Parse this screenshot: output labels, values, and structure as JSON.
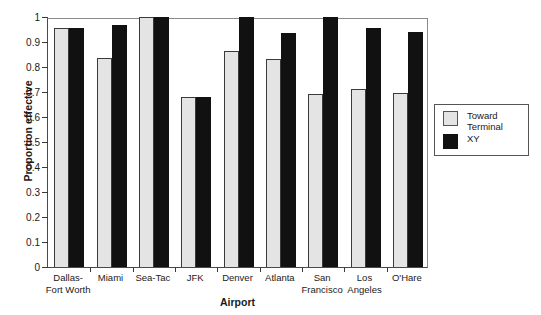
{
  "chart_data": {
    "type": "bar",
    "title": "",
    "xlabel": "Airport",
    "ylabel": "Proportion effective",
    "ylim": [
      0,
      1
    ],
    "ytick_labels": [
      "0",
      "0.1",
      "0.2",
      "0.3",
      "0.4",
      "0.5",
      "0.6",
      "0.7",
      "0.8",
      "0.9",
      "1"
    ],
    "ytick_values": [
      0,
      0.1,
      0.2,
      0.3,
      0.4,
      0.5,
      0.6,
      0.7,
      0.8,
      0.9,
      1
    ],
    "grid": false,
    "legend_position": "right-outside",
    "categories": [
      "Dallas-\nFort Worth",
      "Miami",
      "Sea-Tac",
      "JFK",
      "Denver",
      "Atlanta",
      "San\nFrancisco",
      "Los\nAngeles",
      "O'Hare"
    ],
    "series": [
      {
        "name": "Toward\nTerminal",
        "color": "#e4e4e4",
        "values": [
          0.955,
          0.835,
          1.0,
          0.68,
          0.865,
          0.832,
          0.692,
          0.713,
          0.698
        ]
      },
      {
        "name": "XY",
        "color": "#111111",
        "values": [
          0.955,
          0.967,
          1.0,
          0.68,
          1.0,
          0.935,
          1.0,
          0.955,
          0.94
        ]
      }
    ]
  }
}
